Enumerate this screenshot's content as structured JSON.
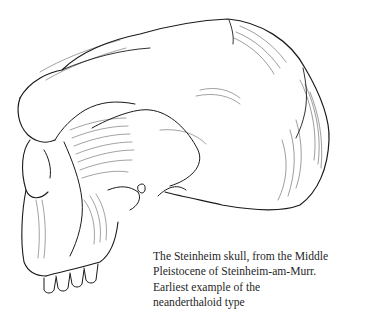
{
  "figure": {
    "style": "pen-and-ink hatched line drawing, lateral view facing left",
    "ink_color": "#1a1a1a",
    "background_color": "#ffffff"
  },
  "caption": {
    "lines": [
      "The Steinheim skull, from the Middle",
      "Pleistocene of Steinheim-am-Murr.",
      "Earliest example of the",
      "neanderthaloid type"
    ]
  }
}
